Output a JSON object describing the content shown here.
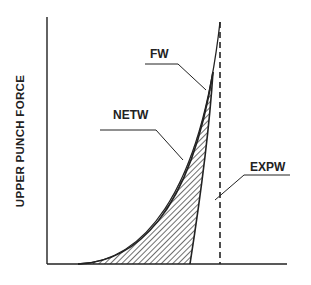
{
  "diagram": {
    "y_axis_label": "UPPER PUNCH FORCE",
    "labels": {
      "fw": "FW",
      "netw": "NETW",
      "expw": "EXPW"
    },
    "colors": {
      "line": "#222222",
      "background": "#ffffff"
    }
  }
}
